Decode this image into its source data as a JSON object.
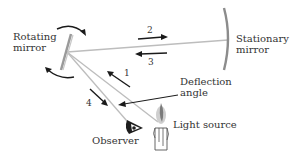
{
  "diagram": {
    "type": "physics-apparatus",
    "colors": {
      "beam": "#bdbdbd",
      "arrow": "#1a1a1a",
      "mirror": "#8c8c8c",
      "text": "#333333"
    },
    "labels": {
      "rotating_mirror_line1": "Rotating",
      "rotating_mirror_line2": "mirror",
      "stationary_mirror_line1": "Stationary",
      "stationary_mirror_line2": "mirror",
      "deflection_angle_line1": "Deflection",
      "deflection_angle_line2": "angle",
      "observer": "Observer",
      "light_source": "Light source"
    },
    "steps": [
      {
        "number": "1",
        "direction": "toward rotating mirror from light source"
      },
      {
        "number": "2",
        "direction": "toward stationary mirror"
      },
      {
        "number": "3",
        "direction": "back toward rotating mirror"
      },
      {
        "number": "4",
        "direction": "toward observer"
      }
    ],
    "icons": {
      "rotation_arrows": "curved-arrow-icon",
      "observer_eye": "eye-icon",
      "light_source": "candle-icon"
    }
  }
}
